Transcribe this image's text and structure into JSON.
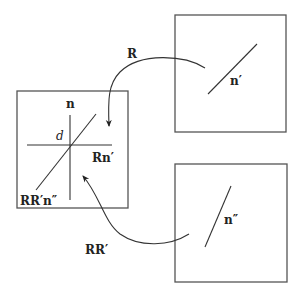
{
  "diagram": {
    "boxes": [
      {
        "id": "target",
        "label_n": "n",
        "label_d": "d",
        "label_rn": "Rn′",
        "label_rrn": "RR′n″"
      },
      {
        "id": "source-top",
        "label": "n′"
      },
      {
        "id": "source-bottom",
        "label": "n″"
      }
    ],
    "arrows": [
      {
        "id": "rotation-r",
        "label": "R",
        "from": "source-top",
        "to": "target"
      },
      {
        "id": "rotation-rr",
        "label": "RR′",
        "from": "source-bottom",
        "to": "target"
      }
    ],
    "colors": {
      "stroke": "#333333",
      "frame": "#555555",
      "background": "#ffffff"
    }
  }
}
